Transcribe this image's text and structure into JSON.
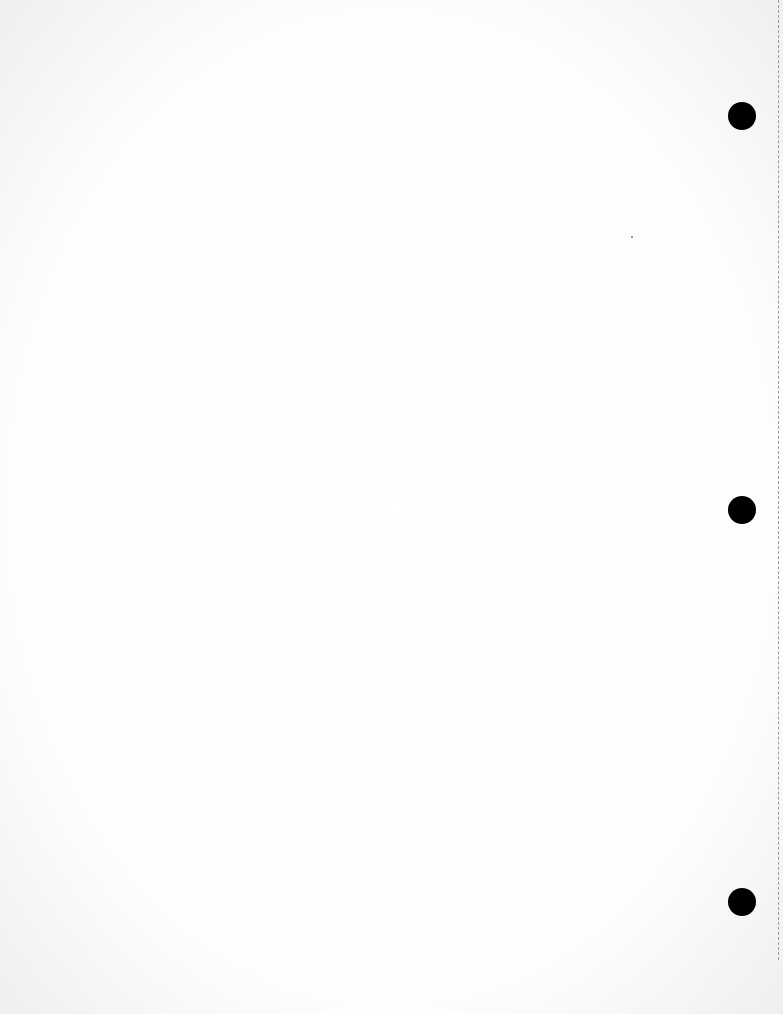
{
  "document": {
    "type": "blank scanned page",
    "text": "",
    "punch_holes": [
      {
        "x": 742,
        "y": 116
      },
      {
        "x": 742,
        "y": 510
      },
      {
        "x": 742,
        "y": 902
      }
    ],
    "colors": {
      "paper": "#ffffff",
      "hole": "#000000",
      "edge_line": "#9a9a9a"
    }
  }
}
